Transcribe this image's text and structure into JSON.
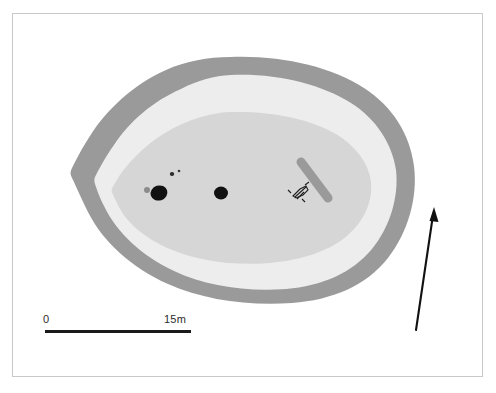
{
  "figure": {
    "kind": "archaeological-site-plan",
    "frame": {
      "visible": true,
      "border_color": "#c9c9c9",
      "background": "#ffffff"
    }
  },
  "colors": {
    "outer_bank": "#9a9a9a",
    "middle_zone": "#ededed",
    "inner_core": "#d6d6d6",
    "feature_dark": "#111111",
    "feature_gray": "#8c8c8c",
    "linear_feature": "#9a9a9a",
    "scale_bar": "#1a1a1a",
    "north_arrow": "#111111",
    "page_background": "#ffffff",
    "frame_border": "#c9c9c9"
  },
  "scale_bar": {
    "start_label": "0",
    "end_label": "15m",
    "unit": "m",
    "length_value": 15,
    "bar_length_px": 146,
    "orientation": "horizontal",
    "position": "bottom-left"
  },
  "north_arrow": {
    "label": "",
    "direction": "up",
    "tilt_degrees": 4,
    "position": "right"
  },
  "zones": [
    {
      "name": "outer-bank-ring",
      "fill": "#9a9a9a",
      "order": 1,
      "note": "outermost dark grey enclosing bank, irregular polygonal outline"
    },
    {
      "name": "middle-light-zone",
      "fill": "#ededed",
      "order": 2,
      "note": "pale band between bank and inner platform"
    },
    {
      "name": "inner-core-platform",
      "fill": "#d6d6d6",
      "order": 3,
      "note": "central grey oval platform containing the excavated features"
    }
  ],
  "features": [
    {
      "name": "pit-large-west",
      "shape": "ellipse",
      "fill": "#111111",
      "cx": 159,
      "cy": 193,
      "rx": 8.5,
      "ry": 7.5
    },
    {
      "name": "pit-large-east",
      "shape": "ellipse",
      "fill": "#111111",
      "cx": 221,
      "cy": 193,
      "rx": 7.0,
      "ry": 6.5
    },
    {
      "name": "posthole-small-west",
      "shape": "ellipse",
      "fill": "#8c8c8c",
      "cx": 147,
      "cy": 190,
      "rx": 3.0,
      "ry": 3.0
    },
    {
      "name": "stakehole-speck-a",
      "shape": "ellipse",
      "fill": "#2a2a2a",
      "cx": 172,
      "cy": 174,
      "rx": 2.2,
      "ry": 2.0
    },
    {
      "name": "stakehole-speck-b",
      "shape": "ellipse",
      "fill": "#3a3a3a",
      "cx": 179,
      "cy": 171,
      "rx": 1.3,
      "ry": 1.2
    },
    {
      "name": "linear-slot-trench",
      "shape": "rounded-bar",
      "fill": "#9a9a9a",
      "x1": 300,
      "y1": 161,
      "x2": 329,
      "y2": 199,
      "thickness": 9
    },
    {
      "name": "hatched-marker",
      "shape": "irregular-hatch",
      "fill": "#1f1f1f",
      "cx": 300,
      "cy": 192
    }
  ]
}
